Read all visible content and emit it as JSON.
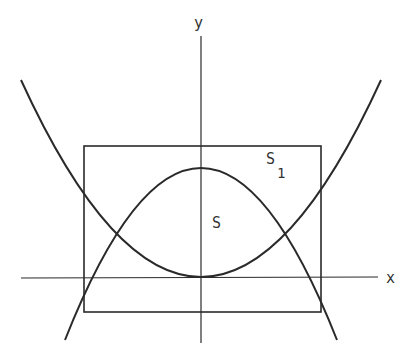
{
  "diagram": {
    "labels": {
      "x_axis": "x",
      "y_axis": "y",
      "region_inner": "S",
      "region_outer": "S",
      "region_outer_subscript": "1"
    },
    "elements": [
      {
        "type": "axis",
        "name": "x-axis"
      },
      {
        "type": "axis",
        "name": "y-axis"
      },
      {
        "type": "curve",
        "name": "upward-parabola",
        "vertex": "origin"
      },
      {
        "type": "curve",
        "name": "downward-parabola",
        "vertex": "on y-axis above origin"
      },
      {
        "type": "rectangle",
        "name": "bounding-rectangle",
        "label": "S1"
      }
    ],
    "colors": {
      "stroke": "#2a2a2a",
      "background": "#ffffff",
      "text": "#333333"
    }
  }
}
